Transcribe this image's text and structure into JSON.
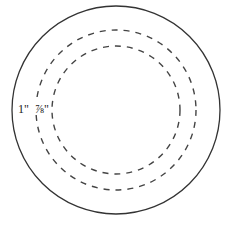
{
  "diagram": {
    "type": "concentric-circles",
    "outer_circle": {
      "cx": 116,
      "cy": 110,
      "r": 104,
      "style": "solid"
    },
    "dashed_circles": [
      {
        "cx": 116,
        "cy": 110,
        "r": 80,
        "style": "dashed"
      },
      {
        "cx": 116,
        "cy": 110,
        "r": 64,
        "style": "dashed"
      }
    ],
    "labels": {
      "outer_margin": "1\"",
      "inner_margin": "⅞\""
    },
    "colors": {
      "stroke": "#333333",
      "dash_stroke": "#444444",
      "background": "#ffffff"
    }
  }
}
